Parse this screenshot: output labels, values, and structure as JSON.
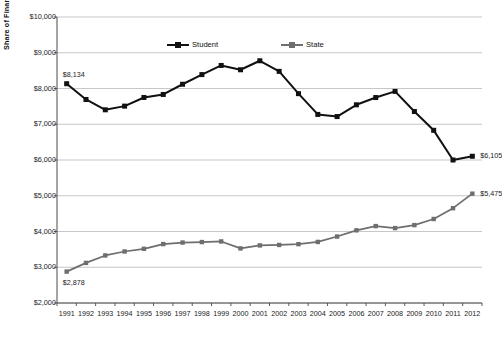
{
  "chart_data": {
    "type": "line",
    "title": "",
    "xlabel": "",
    "ylabel": "Share of Financing Public Higher Education",
    "categories": [
      "1991",
      "1992",
      "1993",
      "1994",
      "1995",
      "1996",
      "1997",
      "1998",
      "1999",
      "2000",
      "2001",
      "2002",
      "2003",
      "2004",
      "2005",
      "2006",
      "2007",
      "2008",
      "2009",
      "2010",
      "2011",
      "2012"
    ],
    "ylim": [
      2000,
      10000
    ],
    "ytick_labels": [
      "$10,000",
      "$9,000",
      "$8,000",
      "$7,000",
      "$6,000",
      "$5,000",
      "$4,000",
      "$3,000",
      "$2,000"
    ],
    "ytick_values": [
      10000,
      9000,
      8000,
      7000,
      6000,
      5000,
      4000,
      3000,
      2000
    ],
    "grid": true,
    "legend_position": "top-center",
    "series": [
      {
        "name": "Student",
        "color": "#111111",
        "values": [
          8134,
          7693,
          7404,
          7507,
          7749,
          7833,
          8119,
          8389,
          8645,
          8524,
          8776,
          8479,
          7856,
          7275,
          7215,
          7544,
          7747,
          7919,
          7356,
          6830,
          6000,
          6105
        ]
      },
      {
        "name": "State",
        "color": "#6e6e6e",
        "values": [
          2878,
          3122,
          3330,
          3441,
          3516,
          3648,
          3691,
          3705,
          3722,
          3527,
          3611,
          3624,
          3646,
          3708,
          3859,
          4033,
          4151,
          4095,
          4179,
          4350,
          4652,
          5058
        ]
      }
    ],
    "data_labels": [
      {
        "text": "$8,134",
        "series": "Student",
        "category": "1991",
        "position": "above-left"
      },
      {
        "text": "$6,105",
        "series": "Student",
        "category": "2012",
        "position": "right"
      },
      {
        "text": "$2,878",
        "series": "State",
        "category": "1991",
        "position": "below"
      },
      {
        "text": "$5,475",
        "series": "State",
        "category": "2012",
        "position": "right"
      }
    ],
    "endpoint_values": {
      "student_first": 8134,
      "student_last": 6105,
      "state_first": 2878,
      "state_last": 5475
    },
    "legend": [
      {
        "label": "Student",
        "color": "#111111"
      },
      {
        "label": "State",
        "color": "#6e6e6e"
      }
    ]
  }
}
